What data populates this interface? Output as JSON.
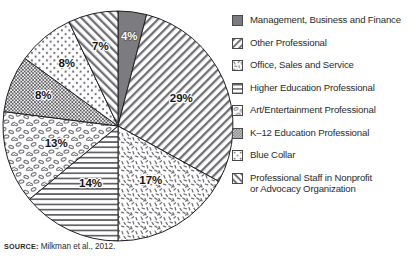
{
  "source": {
    "label": "SOURCE:",
    "text": " Milkman et al., 2012."
  },
  "legend": {
    "items": [
      {
        "label": "Management, Business and Finance",
        "pattern": "solid-gray"
      },
      {
        "label": "Other Professional",
        "pattern": "diagonal-forward"
      },
      {
        "label": "Office, Sales and Service",
        "pattern": "speckle"
      },
      {
        "label": "Higher Education Professional",
        "pattern": "horizontal-lines"
      },
      {
        "label": "Art/Entertainment Professional",
        "pattern": "ovals"
      },
      {
        "label": "K–12 Education Professional",
        "pattern": "dense-dots"
      },
      {
        "label": "Blue Collar",
        "pattern": "sparse-dots"
      },
      {
        "label": "Professional Staff in Nonprofit\nor Advocacy Organization",
        "pattern": "diagonal-back"
      }
    ]
  },
  "chart_data": {
    "type": "pie",
    "title": "",
    "legend_position": "right",
    "start_angle_deg": 0,
    "direction": "clockwise",
    "labels": [
      "Management, Business and Finance",
      "Other Professional",
      "Office, Sales and Service",
      "Higher Education Professional",
      "Art/Entertainment Professional",
      "K–12 Education Professional",
      "Blue Collar",
      "Professional Staff in Nonprofit or Advocacy Organization"
    ],
    "values": [
      4,
      29,
      17,
      14,
      13,
      8,
      8,
      7
    ],
    "value_labels": [
      "4%",
      "29%",
      "17%",
      "14%",
      "13%",
      "8%",
      "8%",
      "7%"
    ],
    "units": "percent",
    "total": 100,
    "slices": [
      {
        "label": "Management, Business and Finance",
        "value": 4,
        "display": "4%",
        "pattern": "solid-gray",
        "label_on_dark": true
      },
      {
        "label": "Other Professional",
        "value": 29,
        "display": "29%",
        "pattern": "diagonal-forward",
        "label_on_dark": false
      },
      {
        "label": "Office, Sales and Service",
        "value": 17,
        "display": "17%",
        "pattern": "speckle",
        "label_on_dark": false
      },
      {
        "label": "Higher Education Professional",
        "value": 14,
        "display": "14%",
        "pattern": "horizontal-lines",
        "label_on_dark": false
      },
      {
        "label": "Art/Entertainment Professional",
        "value": 13,
        "display": "13%",
        "pattern": "ovals",
        "label_on_dark": false
      },
      {
        "label": "K–12 Education Professional",
        "value": 8,
        "display": "8%",
        "pattern": "dense-dots",
        "label_on_dark": false
      },
      {
        "label": "Blue Collar",
        "value": 8,
        "display": "8%",
        "pattern": "sparse-dots",
        "label_on_dark": false
      },
      {
        "label": "Professional Staff in Nonprofit or Advocacy Organization",
        "value": 7,
        "display": "7%",
        "pattern": "diagonal-back",
        "label_on_dark": false
      }
    ]
  },
  "colors": {
    "solid_gray": "#7b7b80",
    "outline": "#231f20",
    "text": "#2b2b2b",
    "background": "#ffffff"
  }
}
